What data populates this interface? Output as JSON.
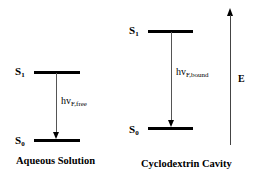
{
  "panels": {
    "aqueous": {
      "caption": "Aqueous Solution",
      "upper_state": {
        "base": "S",
        "sub": "1"
      },
      "lower_state": {
        "base": "S",
        "sub": "0"
      },
      "transition": {
        "base": "hv",
        "sub": "F,free"
      }
    },
    "cyclodextrin": {
      "caption": "Cyclodextrin Cavity",
      "upper_state": {
        "base": "S",
        "sub": "1"
      },
      "lower_state": {
        "base": "S",
        "sub": "0"
      },
      "transition": {
        "base": "hv",
        "sub": "F,bound"
      }
    }
  },
  "energy_axis": {
    "label": "E"
  }
}
